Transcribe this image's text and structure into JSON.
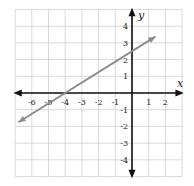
{
  "chart_data": {
    "type": "line",
    "title": "",
    "xlabel": "x",
    "ylabel": "y",
    "xlim": [
      -7,
      3
    ],
    "ylim": [
      -5,
      5
    ],
    "grid": true,
    "x_ticks": [
      -6,
      -5,
      -4,
      -3,
      -2,
      -1,
      1,
      2
    ],
    "y_ticks": [
      4,
      3,
      2,
      1,
      -1,
      -2,
      -3,
      -4
    ],
    "series": [
      {
        "name": "line",
        "equation": "y = 0.625x + 2.5",
        "x": [
          -6.8,
          -4,
          0,
          1.4
        ],
        "y": [
          -1.75,
          0,
          2.5,
          3.375
        ],
        "color": "#8a8a8a",
        "arrows": "both"
      }
    ],
    "colors": {
      "axis": "#111111",
      "grid": "#cfcfcf",
      "line": "#8a8a8a"
    }
  },
  "labels": {
    "x_axis": "x",
    "y_axis": "y"
  }
}
